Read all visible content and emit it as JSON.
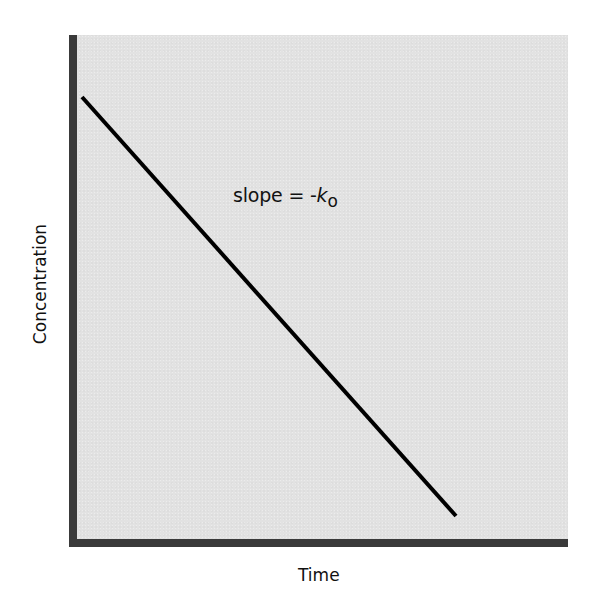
{
  "chart_data": {
    "type": "line",
    "title": "",
    "xlabel": "Time",
    "ylabel": "Concentration",
    "x_ticks": [],
    "y_ticks": [],
    "grid": false,
    "legend": null,
    "series": [
      {
        "name": "zero-order elimination",
        "description": "Linear decrease of concentration over time",
        "points_px": [
          [
            82,
            97
          ],
          [
            456,
            516
          ]
        ],
        "x": [
          0,
          1
        ],
        "y": [
          1,
          0.06
        ]
      }
    ],
    "annotations": [
      {
        "text": "slope = -k0",
        "display": {
          "prefix": "slope = -",
          "symbol": "k",
          "subscript": "o"
        },
        "position_px": [
          233,
          184
        ]
      }
    ],
    "colors": {
      "plot_background": "#e2e2e2",
      "axis": "#3a3a3a",
      "line": "#000000"
    }
  },
  "labels": {
    "x_axis": "Time",
    "y_axis": "Concentration",
    "annotation_prefix": "slope = -",
    "annotation_symbol": "k",
    "annotation_subscript": "o"
  }
}
